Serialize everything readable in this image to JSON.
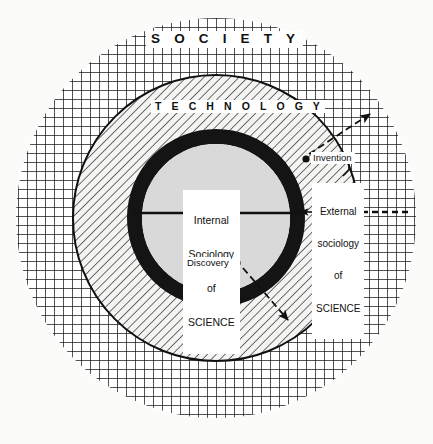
{
  "figure": {
    "kind": "concentric-circles-sociology-of-science-diagram",
    "background_color": "#fbfbfa",
    "ink_color": "#101010"
  },
  "regions": {
    "society": {
      "label": "S O C I E T Y",
      "fill_pattern": "cross-hatch-grid",
      "fill_color": "#ffffff",
      "line_color": "#1a1a1a"
    },
    "technology": {
      "label": "T E C H N O L O G Y",
      "fill_pattern": "diagonal-hatch-45",
      "fill_color": "#f2f2f0",
      "line_color": "#1a1a1a"
    },
    "boundary_ring": {
      "label": "",
      "fill_pattern": "solid",
      "fill_color": "#141414"
    },
    "core": {
      "fill_pattern": "solid",
      "fill_color": "#d9d9d9"
    }
  },
  "labels": {
    "society": "S O C I E T Y",
    "technology": "T E C H N O L O G Y",
    "internal_sociology": {
      "line1": "Internal",
      "line2": "Sociology",
      "line3": "of",
      "line4": "SCIENCE"
    },
    "external_sociology": {
      "line1": "External",
      "line2": "sociology",
      "line3": "of",
      "line4": "SCIENCE"
    },
    "invention": "Invention",
    "discovery": "Discovery"
  },
  "annotations": [
    {
      "name": "invention-marker",
      "type": "dot",
      "label": "Invention",
      "x": 306,
      "y": 159
    },
    {
      "name": "invention-arrow",
      "type": "dashed-arrow",
      "from": [
        310,
        152
      ],
      "to": [
        372,
        113
      ],
      "direction": "outward-to-society"
    },
    {
      "name": "discovery-marker",
      "type": "dot",
      "label": "Discovery",
      "x": 237,
      "y": 263
    },
    {
      "name": "discovery-arrow",
      "type": "dashed-arrow",
      "from": [
        244,
        269
      ],
      "to": [
        290,
        323
      ],
      "direction": "outward-to-technology"
    },
    {
      "name": "external-pointer-arrow",
      "type": "arrow",
      "from": [
        316,
        212
      ],
      "to": [
        299,
        212
      ],
      "direction": "inward-to-boundary"
    },
    {
      "name": "diameter-line",
      "type": "line",
      "from": [
        133,
        213
      ],
      "to": [
        300,
        213
      ]
    },
    {
      "name": "external-dashed-rule",
      "type": "dashed-line",
      "from": [
        352,
        212
      ],
      "to": [
        408,
        212
      ]
    }
  ],
  "geometry": {
    "center": [
      216,
      218
    ],
    "society_radius": 200,
    "technology_radius": 143,
    "ring_outer_radius": 89,
    "ring_inner_radius": 74
  }
}
